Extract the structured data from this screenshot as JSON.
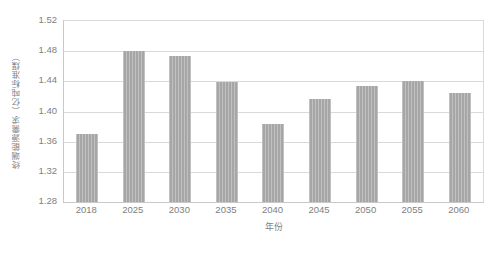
{
  "chart_data": {
    "type": "bar",
    "title": "",
    "xlabel": "年份",
    "ylabel": "终端能源需求（亿吨标准煤）",
    "categories": [
      "2018",
      "2025",
      "2030",
      "2035",
      "2040",
      "2045",
      "2050",
      "2055",
      "2060"
    ],
    "values": [
      1.37,
      1.48,
      1.473,
      1.439,
      1.384,
      1.416,
      1.434,
      1.44,
      1.425
    ],
    "ylim": [
      1.28,
      1.52
    ],
    "ytick_labels": [
      "1.52",
      "1.48",
      "1.44",
      "1.40",
      "1.36",
      "1.32",
      "1.28"
    ],
    "ytick_values": [
      1.52,
      1.48,
      1.44,
      1.4,
      1.36,
      1.32,
      1.28
    ],
    "grid": true,
    "legend": "none",
    "series": [
      {
        "name": "终端能源需求",
        "values": [
          1.37,
          1.48,
          1.473,
          1.439,
          1.384,
          1.416,
          1.434,
          1.44,
          1.425
        ]
      }
    ],
    "colors": {
      "bar": "#a6a6a6",
      "grid": "#d9d9d9",
      "axis": "#c8c8c8",
      "text": "#808080",
      "background": "#ffffff"
    }
  }
}
